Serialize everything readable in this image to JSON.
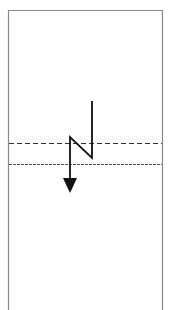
{
  "diagram": {
    "colors": {
      "frame": "#888888",
      "arrow": "#111111",
      "dashed_line_1": "#333333",
      "dashed_line_2": "#555555"
    },
    "frame": {
      "x": 8,
      "y": 10,
      "width": 154,
      "height": 300
    },
    "dashed_lines": [
      {
        "y": 143,
        "style": "dashed"
      },
      {
        "y": 164,
        "style": "fine-dashed"
      }
    ],
    "arrow": {
      "points": [
        [
          92,
          101
        ],
        [
          92,
          158
        ],
        [
          70,
          137
        ],
        [
          70,
          180
        ]
      ],
      "tip": [
        70,
        193
      ]
    }
  }
}
